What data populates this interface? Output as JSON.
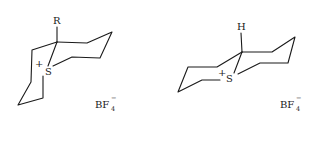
{
  "figure": {
    "structures": [
      {
        "id": "left",
        "substituent_label": "R",
        "heteroatom_label": "S",
        "charge_label": "+",
        "counterion": {
          "main": "BF",
          "subscript": "4",
          "superscript": "−"
        }
      },
      {
        "id": "right",
        "substituent_label": "H",
        "heteroatom_label": "S",
        "charge_label": "+",
        "counterion": {
          "main": "BF",
          "subscript": "4",
          "superscript": "−"
        }
      }
    ]
  }
}
